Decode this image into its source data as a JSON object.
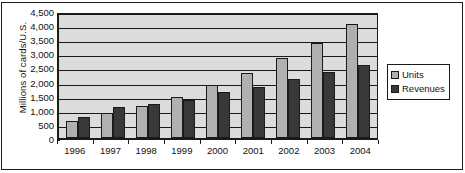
{
  "chart_data": {
    "type": "bar",
    "title": "",
    "xlabel": "",
    "ylabel": "Millions of cards/U.S.",
    "categories": [
      "1996",
      "1997",
      "1998",
      "1999",
      "2000",
      "2001",
      "2002",
      "2003",
      "2004"
    ],
    "series": [
      {
        "name": "Units",
        "color": "#b0b0b0",
        "values": [
          620,
          890,
          1130,
          1470,
          1880,
          2300,
          2820,
          3380,
          4050
        ]
      },
      {
        "name": "Revenues",
        "color": "#383838",
        "values": [
          750,
          1090,
          1190,
          1330,
          1620,
          1810,
          2080,
          2330,
          2580
        ]
      }
    ],
    "ylim": [
      0,
      4500
    ],
    "ytick_step": 500,
    "ytick_labels": [
      "4,500",
      "4,000",
      "3,500",
      "3,000",
      "2,500",
      "2,000",
      "1,500",
      "1,000",
      "500",
      "0"
    ],
    "grid": true,
    "grid_axis": "y",
    "legend_position": "right",
    "plot_background": "#dcdcdc",
    "figure_background": "#ffffff",
    "axis_color": "#1a1a1a"
  }
}
